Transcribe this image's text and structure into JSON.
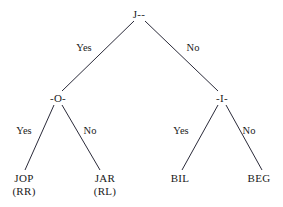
{
  "figure": {
    "type": "binary-decision-tree",
    "background_color": "#ffffff",
    "line_color": "#2b2b3a",
    "text_color": "#1a1a1a"
  },
  "nodes": {
    "root": {
      "label": "J--",
      "x": 139,
      "y": 14
    },
    "left_internal": {
      "label": "-O-",
      "x": 58,
      "y": 98
    },
    "right_internal": {
      "label": "-I-",
      "x": 222,
      "y": 98
    },
    "leaf_1": {
      "name": "JOP",
      "sub": "(RR)",
      "x": 24,
      "y": 182
    },
    "leaf_2": {
      "name": "JAR",
      "sub": "(RL)",
      "x": 105,
      "y": 182
    },
    "leaf_3": {
      "name": "BIL",
      "sub": "",
      "x": 180,
      "y": 182
    },
    "leaf_4": {
      "name": "BEG",
      "sub": "",
      "x": 259,
      "y": 182
    }
  },
  "edge_labels": {
    "root_yes": {
      "text": "Yes",
      "x": 84,
      "y": 47
    },
    "root_no": {
      "text": "No",
      "x": 193,
      "y": 47
    },
    "left_yes": {
      "text": "Yes",
      "x": 24,
      "y": 130
    },
    "left_no": {
      "text": "No",
      "x": 90,
      "y": 130
    },
    "right_yes": {
      "text": "Yes",
      "x": 181,
      "y": 130
    },
    "right_no": {
      "text": "No",
      "x": 249,
      "y": 130
    }
  },
  "edges": [
    {
      "from": "root",
      "to": "left_internal",
      "x1": 134,
      "y1": 21,
      "x2": 62,
      "y2": 91
    },
    {
      "from": "root",
      "to": "right_internal",
      "x1": 145,
      "y1": 21,
      "x2": 218,
      "y2": 91
    },
    {
      "from": "left_internal",
      "to": "leaf_1",
      "x1": 54,
      "y1": 105,
      "x2": 25,
      "y2": 170
    },
    {
      "from": "left_internal",
      "to": "leaf_2",
      "x1": 62,
      "y1": 105,
      "x2": 100,
      "y2": 170
    },
    {
      "from": "right_internal",
      "to": "leaf_3",
      "x1": 218,
      "y1": 105,
      "x2": 182,
      "y2": 170
    },
    {
      "from": "right_internal",
      "to": "leaf_4",
      "x1": 226,
      "y1": 105,
      "x2": 262,
      "y2": 170
    }
  ]
}
